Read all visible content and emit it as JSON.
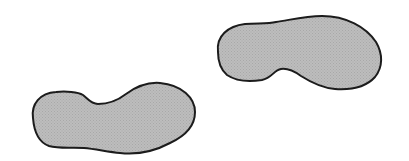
{
  "scene": {
    "background": "#ffffff",
    "width": 409,
    "height": 161
  },
  "colors": {
    "fill": "#bdbdbd",
    "fill_dot": "#a8a8a8",
    "stroke": "#1c1c1c"
  },
  "footprints": [
    {
      "id": "left-footprint",
      "description": "lower-left shoe sole print, toe pointing right",
      "path": "M 33 118 C 31 104, 40 93, 56 92 C 66 91, 78 92, 83 95 C 88 99, 91 104, 98 104 C 108 104, 117 101, 126 94 C 137 86, 148 82, 160 83 C 182 85, 195 98, 195 112 C 195 127, 183 137, 170 143 C 155 151, 138 155, 120 153 C 108 152, 96 149, 84 148 C 72 147, 60 149, 49 146 C 38 142, 34 131, 33 118 Z"
    },
    {
      "id": "right-footprint",
      "description": "upper-right shoe sole print, toe pointing right",
      "path": "M 218 52 C 216 36, 228 26, 245 24 C 258 23, 268 24, 276 22 C 290 20, 305 16, 322 16 C 346 16, 366 27, 376 42 C 383 54, 383 67, 375 77 C 366 87, 350 90, 335 89 C 322 88, 312 83, 301 76 C 294 71, 288 68, 281 69 C 274 70, 272 78, 262 80 C 250 82, 236 81, 227 75 C 220 69, 218 61, 218 52 Z"
    }
  ]
}
